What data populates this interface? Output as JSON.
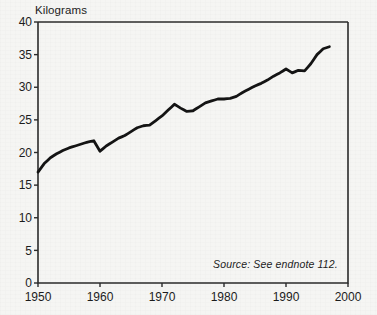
{
  "chart_data": {
    "type": "line",
    "title": "",
    "ylabel": "Kilograms",
    "xlabel": "",
    "xlim": [
      1950,
      2000
    ],
    "ylim": [
      0,
      40
    ],
    "grid": false,
    "legend": null,
    "y_ticks": [
      0,
      5,
      10,
      15,
      20,
      25,
      30,
      35,
      40
    ],
    "y_tick_labels": [
      "0",
      "5",
      "10",
      "15",
      "20",
      "25",
      "30",
      "35",
      "40"
    ],
    "x_ticks": [
      1950,
      1960,
      1970,
      1980,
      1990,
      2000
    ],
    "x_tick_labels": [
      "1950",
      "1960",
      "1970",
      "1980",
      "1990",
      "2000"
    ],
    "line_color": "#141414",
    "line_width": 2.8,
    "annotation": "Source: See endnote 112.",
    "x": [
      1950,
      1951,
      1952,
      1953,
      1954,
      1955,
      1956,
      1957,
      1958,
      1959,
      1960,
      1961,
      1962,
      1963,
      1964,
      1965,
      1966,
      1967,
      1968,
      1969,
      1970,
      1971,
      1972,
      1973,
      1974,
      1975,
      1976,
      1977,
      1978,
      1979,
      1980,
      1981,
      1982,
      1983,
      1984,
      1985,
      1986,
      1987,
      1988,
      1989,
      1990,
      1991,
      1992,
      1993,
      1994,
      1995,
      1996,
      1997
    ],
    "values": [
      17.0,
      18.3,
      19.2,
      19.8,
      20.3,
      20.7,
      21.0,
      21.3,
      21.6,
      21.8,
      20.2,
      21.0,
      21.6,
      22.2,
      22.6,
      23.2,
      23.8,
      24.1,
      24.2,
      24.9,
      25.6,
      26.5,
      27.4,
      26.8,
      26.3,
      26.4,
      27.0,
      27.6,
      27.9,
      28.2,
      28.2,
      28.3,
      28.6,
      29.2,
      29.7,
      30.2,
      30.6,
      31.1,
      31.7,
      32.2,
      32.8,
      32.2,
      32.6,
      32.5,
      33.6,
      35.0,
      35.9,
      36.2
    ],
    "series": [
      {
        "name": "Kilograms",
        "values": [
          17.0,
          18.3,
          19.2,
          19.8,
          20.3,
          20.7,
          21.0,
          21.3,
          21.6,
          21.8,
          20.2,
          21.0,
          21.6,
          22.2,
          22.6,
          23.2,
          23.8,
          24.1,
          24.2,
          24.9,
          25.6,
          26.5,
          27.4,
          26.8,
          26.3,
          26.4,
          27.0,
          27.6,
          27.9,
          28.2,
          28.2,
          28.3,
          28.6,
          29.2,
          29.7,
          30.2,
          30.6,
          31.1,
          31.7,
          32.2,
          32.8,
          32.2,
          32.6,
          32.5,
          33.6,
          35.0,
          35.9,
          36.2
        ]
      }
    ]
  },
  "figure": {
    "y_axis_title": "Kilograms",
    "source_note": "Source: See endnote 112.",
    "background_color": "#f5f5f3",
    "axis_color": "#2b2b2b",
    "text_color": "#1c1c1c"
  }
}
